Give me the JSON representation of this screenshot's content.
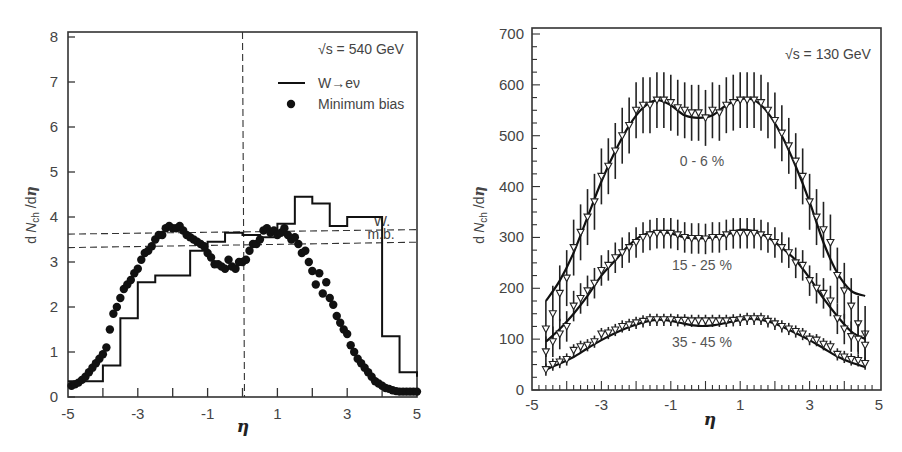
{
  "chart_data": [
    {
      "type": "line",
      "panel": "left",
      "annotation": "√s = 540 GeV",
      "xlabel": "η",
      "ylabel": "dN_ch/dη",
      "xlim": [
        -5,
        5
      ],
      "ylim": [
        0,
        8
      ],
      "xticks": [
        "-5",
        "-3",
        "-1",
        "1",
        "3",
        "5"
      ],
      "yticks": [
        "0",
        "1",
        "2",
        "3",
        "4",
        "5",
        "6",
        "7",
        "8"
      ],
      "legend": [
        {
          "label": "W→eν",
          "style": "solid line (histogram)"
        },
        {
          "label": "Minimum bias",
          "style": "filled circles"
        }
      ],
      "reference_lines": [
        {
          "label": "W.",
          "y": 3.65,
          "style": "dashed"
        },
        {
          "label": "m.b.",
          "y": 3.35,
          "style": "dashed"
        },
        {
          "label": "",
          "x": 0,
          "style": "dashed vertical"
        }
      ],
      "series": [
        {
          "name": "W→eν",
          "kind": "step",
          "bin_edges": [
            -5,
            -4,
            -3.5,
            -3,
            -2.5,
            -1.5,
            -1,
            -0.5,
            0,
            0.5,
            1,
            1.5,
            2,
            2.5,
            3,
            4,
            4.5,
            5
          ],
          "values": [
            0.35,
            0.7,
            1.75,
            2.55,
            2.7,
            3.25,
            3.45,
            3.65,
            3.6,
            3.55,
            3.85,
            4.45,
            4.3,
            3.8,
            4.0,
            1.35,
            0.55,
            0.45
          ]
        },
        {
          "name": "Minimum bias",
          "kind": "scatter",
          "x": [
            -4.9,
            -4.8,
            -4.7,
            -4.6,
            -4.5,
            -4.4,
            -4.3,
            -4.2,
            -4.1,
            -4.0,
            -3.9,
            -3.8,
            -3.7,
            -3.6,
            -3.5,
            -3.4,
            -3.3,
            -3.2,
            -3.1,
            -3.0,
            -2.9,
            -2.8,
            -2.7,
            -2.6,
            -2.5,
            -2.4,
            -2.3,
            -2.2,
            -2.1,
            -2.0,
            -1.9,
            -1.8,
            -1.7,
            -1.6,
            -1.5,
            -1.4,
            -1.3,
            -1.2,
            -1.1,
            -1.0,
            -0.9,
            -0.8,
            -0.7,
            -0.6,
            -0.5,
            -0.4,
            -0.3,
            -0.2,
            -0.1,
            0.0,
            0.1,
            0.2,
            0.3,
            0.4,
            0.5,
            0.6,
            0.7,
            0.8,
            0.9,
            1.0,
            1.1,
            1.2,
            1.3,
            1.4,
            1.5,
            1.6,
            1.7,
            1.8,
            1.9,
            2.0,
            2.1,
            2.2,
            2.3,
            2.4,
            2.5,
            2.6,
            2.7,
            2.8,
            2.9,
            3.0,
            3.1,
            3.2,
            3.3,
            3.4,
            3.5,
            3.6,
            3.7,
            3.8,
            3.9,
            4.0,
            4.1,
            4.2,
            4.3,
            4.4,
            4.5,
            4.6,
            4.7,
            4.8,
            4.9,
            5.0
          ],
          "values": [
            0.25,
            0.28,
            0.32,
            0.38,
            0.45,
            0.55,
            0.65,
            0.75,
            0.85,
            0.95,
            1.1,
            1.5,
            1.85,
            2.0,
            2.2,
            2.4,
            2.5,
            2.6,
            2.75,
            2.85,
            3.05,
            3.2,
            3.25,
            3.35,
            3.5,
            3.6,
            3.6,
            3.75,
            3.8,
            3.75,
            3.75,
            3.8,
            3.7,
            3.6,
            3.55,
            3.5,
            3.45,
            3.4,
            3.35,
            3.2,
            3.1,
            2.95,
            2.95,
            2.9,
            2.85,
            3.05,
            2.9,
            2.85,
            3.0,
            3.0,
            3.05,
            3.25,
            3.4,
            3.4,
            3.5,
            3.7,
            3.75,
            3.65,
            3.7,
            3.6,
            3.65,
            3.75,
            3.6,
            3.5,
            3.55,
            3.4,
            3.2,
            3.25,
            3.0,
            2.8,
            2.5,
            2.75,
            2.3,
            2.55,
            2.2,
            2.05,
            1.8,
            1.65,
            1.5,
            1.4,
            1.15,
            1.0,
            0.85,
            0.75,
            0.65,
            0.55,
            0.45,
            0.35,
            0.3,
            0.25,
            0.2,
            0.18,
            0.15,
            0.13,
            0.12,
            0.12,
            0.12,
            0.12,
            0.12,
            0.12
          ]
        }
      ]
    },
    {
      "type": "line",
      "panel": "right",
      "annotation": "√s = 130 GeV",
      "xlabel": "η",
      "ylabel": "dN_ch/dη",
      "xlim": [
        -5,
        5
      ],
      "ylim": [
        0,
        700
      ],
      "xticks": [
        "-5",
        "-3",
        "-1",
        "1",
        "3",
        "5"
      ],
      "yticks": [
        "0",
        "100",
        "200",
        "300",
        "400",
        "500",
        "600",
        "700"
      ],
      "grid": false,
      "series": [
        {
          "name": "0 - 6 %",
          "label_pos": {
            "x": -0.1,
            "y": 440
          },
          "curve_x": [
            -4.6,
            -4.2,
            -3.8,
            -3.4,
            -3.0,
            -2.6,
            -2.2,
            -1.8,
            -1.4,
            -1.0,
            -0.6,
            -0.2,
            0.2,
            0.6,
            1.0,
            1.4,
            1.8,
            2.2,
            2.6,
            3.0,
            3.4,
            3.8,
            4.2,
            4.6
          ],
          "curve_y": [
            175,
            215,
            270,
            340,
            410,
            470,
            520,
            555,
            570,
            560,
            540,
            535,
            540,
            560,
            572,
            570,
            545,
            500,
            440,
            370,
            290,
            230,
            195,
            185
          ],
          "points_x": [
            -4.6,
            -4.4,
            -4.2,
            -4.0,
            -3.8,
            -3.6,
            -3.4,
            -3.2,
            -3.0,
            -2.8,
            -2.6,
            -2.4,
            -2.2,
            -2.0,
            -1.8,
            -1.6,
            -1.4,
            -1.2,
            -1.0,
            -0.8,
            -0.6,
            -0.4,
            -0.2,
            0.0,
            0.2,
            0.4,
            0.6,
            0.8,
            1.0,
            1.2,
            1.4,
            1.6,
            1.8,
            2.0,
            2.2,
            2.4,
            2.6,
            2.8,
            3.0,
            3.2,
            3.4,
            3.6,
            3.8,
            4.0,
            4.2,
            4.4,
            4.6
          ],
          "points_y": [
            120,
            150,
            190,
            220,
            280,
            310,
            340,
            370,
            420,
            440,
            470,
            500,
            520,
            550,
            560,
            560,
            570,
            570,
            565,
            555,
            550,
            545,
            545,
            535,
            550,
            545,
            560,
            565,
            570,
            570,
            570,
            565,
            550,
            530,
            505,
            480,
            450,
            420,
            370,
            340,
            315,
            290,
            225,
            195,
            165,
            130,
            110
          ],
          "error_bar_approx": 55
        },
        {
          "name": "15 - 25 %",
          "label_pos": {
            "x": -0.1,
            "y": 235
          },
          "curve_x": [
            -4.6,
            -4.2,
            -3.8,
            -3.4,
            -3.0,
            -2.6,
            -2.2,
            -1.8,
            -1.4,
            -1.0,
            -0.6,
            -0.2,
            0.2,
            0.6,
            1.0,
            1.4,
            1.8,
            2.2,
            2.6,
            3.0,
            3.4,
            3.8,
            4.2,
            4.6
          ],
          "curve_y": [
            95,
            120,
            150,
            185,
            225,
            255,
            285,
            305,
            312,
            308,
            300,
            298,
            300,
            305,
            315,
            312,
            300,
            280,
            255,
            220,
            180,
            145,
            115,
            100
          ],
          "points_x": [
            -4.6,
            -4.4,
            -4.2,
            -4.0,
            -3.8,
            -3.6,
            -3.4,
            -3.2,
            -3.0,
            -2.8,
            -2.6,
            -2.4,
            -2.2,
            -2.0,
            -1.8,
            -1.6,
            -1.4,
            -1.2,
            -1.0,
            -0.8,
            -0.6,
            -0.4,
            -0.2,
            0.0,
            0.2,
            0.4,
            0.6,
            0.8,
            1.0,
            1.2,
            1.4,
            1.6,
            1.8,
            2.0,
            2.2,
            2.4,
            2.6,
            2.8,
            3.0,
            3.2,
            3.4,
            3.6,
            3.8,
            4.0,
            4.2,
            4.4,
            4.6
          ],
          "points_y": [
            75,
            95,
            110,
            125,
            165,
            180,
            195,
            210,
            235,
            245,
            260,
            270,
            280,
            290,
            300,
            305,
            308,
            308,
            308,
            305,
            300,
            298,
            298,
            297,
            300,
            300,
            305,
            308,
            308,
            308,
            308,
            305,
            300,
            290,
            280,
            270,
            250,
            245,
            215,
            200,
            190,
            175,
            140,
            120,
            105,
            100,
            88
          ],
          "error_bar_approx": 30
        },
        {
          "name": "35 - 45 %",
          "label_pos": {
            "x": -0.1,
            "y": 85
          },
          "curve_x": [
            -4.6,
            -4.2,
            -3.8,
            -3.4,
            -3.0,
            -2.6,
            -2.2,
            -1.8,
            -1.4,
            -1.0,
            -0.6,
            -0.2,
            0.2,
            0.6,
            1.0,
            1.4,
            1.8,
            2.2,
            2.6,
            3.0,
            3.4,
            3.8,
            4.2,
            4.6
          ],
          "curve_y": [
            40,
            52,
            65,
            82,
            98,
            112,
            124,
            133,
            138,
            136,
            130,
            126,
            127,
            132,
            138,
            140,
            135,
            125,
            112,
            98,
            82,
            66,
            54,
            45
          ],
          "points_x": [
            -4.6,
            -4.4,
            -4.2,
            -4.0,
            -3.8,
            -3.6,
            -3.4,
            -3.2,
            -3.0,
            -2.8,
            -2.6,
            -2.4,
            -2.2,
            -2.0,
            -1.8,
            -1.6,
            -1.4,
            -1.2,
            -1.0,
            -0.8,
            -0.6,
            -0.4,
            -0.2,
            0.0,
            0.2,
            0.4,
            0.6,
            0.8,
            1.0,
            1.2,
            1.4,
            1.6,
            1.8,
            2.0,
            2.2,
            2.4,
            2.6,
            2.8,
            3.0,
            3.2,
            3.4,
            3.6,
            3.8,
            4.0,
            4.2,
            4.4,
            4.6
          ],
          "points_y": [
            40,
            50,
            55,
            60,
            78,
            85,
            88,
            95,
            110,
            112,
            118,
            125,
            128,
            132,
            135,
            138,
            138,
            138,
            138,
            137,
            137,
            136,
            136,
            136,
            136,
            136,
            136,
            137,
            138,
            140,
            140,
            140,
            135,
            130,
            125,
            120,
            115,
            110,
            100,
            98,
            90,
            85,
            70,
            65,
            60,
            58,
            52
          ],
          "error_bar_approx": 12
        }
      ]
    }
  ]
}
